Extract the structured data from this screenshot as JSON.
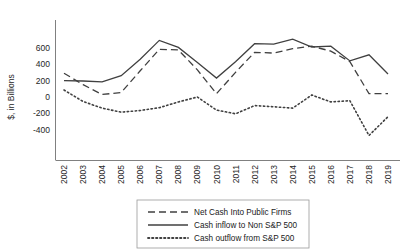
{
  "chart_data": {
    "type": "line",
    "title": "",
    "xlabel": "",
    "ylabel": "$, in Billions",
    "ylim": [
      -500,
      700
    ],
    "yticks": [
      600,
      400,
      200,
      0,
      -200,
      -400
    ],
    "ytick_labels": [
      "600",
      "400",
      "200",
      "0",
      "-200",
      "-400"
    ],
    "grid": false,
    "legend_position": "bottom-center",
    "categories": [
      "2002",
      "2003",
      "2004",
      "2005",
      "2006",
      "2007",
      "2008",
      "2009",
      "2010",
      "2011",
      "2012",
      "2013",
      "2014",
      "2015",
      "2016",
      "2017",
      "2018",
      "2019"
    ],
    "series": [
      {
        "name": "Net Cash Into Public Firms",
        "style": "dashed",
        "color": "#595959",
        "values": [
          290,
          150,
          30,
          55,
          320,
          580,
          575,
          330,
          40,
          300,
          545,
          535,
          590,
          620,
          560,
          430,
          40,
          40
        ]
      },
      {
        "name": "Cash inflow to Non S&P 500",
        "style": "solid",
        "color": "#404040",
        "values": [
          200,
          195,
          185,
          260,
          460,
          690,
          605,
          420,
          230,
          430,
          650,
          645,
          705,
          610,
          620,
          440,
          515,
          280
        ]
      },
      {
        "name": "Cash outflow from S&P 500",
        "style": "dotted",
        "color": "#333333",
        "values": [
          85,
          -55,
          -135,
          -185,
          -165,
          -130,
          -60,
          0,
          -160,
          -205,
          -105,
          -120,
          -135,
          25,
          -60,
          -45,
          -470,
          -240
        ]
      }
    ]
  },
  "legend": {
    "items": [
      {
        "label": "Net Cash Into Public Firms",
        "style": "dashed"
      },
      {
        "label": "Cash inflow to Non S&P 500",
        "style": "solid"
      },
      {
        "label": "Cash outflow from S&P 500",
        "style": "dotted"
      }
    ]
  }
}
